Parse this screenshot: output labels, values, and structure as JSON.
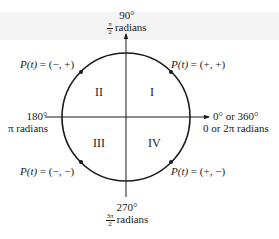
{
  "diagram": {
    "type": "unit-circle-quadrants",
    "center": {
      "x": 126,
      "y": 117
    },
    "radius": 64,
    "colors": {
      "stroke": "#1a1a1a",
      "background": "#ffffff",
      "band": "#f4f4f4"
    }
  },
  "axes": {
    "top": {
      "degrees": "90°",
      "radians_num": "π",
      "radians_den": "2",
      "radians_word": "radians"
    },
    "left": {
      "degrees": "180°",
      "radians": "π radians"
    },
    "right": {
      "degrees": "0° or 360°",
      "radians": "0 or 2π radians"
    },
    "bottom": {
      "degrees": "270°",
      "radians_num": "3π",
      "radians_den": "2",
      "radians_word": "radians"
    }
  },
  "quadrants": [
    {
      "numeral": "I"
    },
    {
      "numeral": "II"
    },
    {
      "numeral": "III"
    },
    {
      "numeral": "IV"
    }
  ],
  "points": [
    {
      "label_fn": "P(t)",
      "label_rest": " = (+, +)",
      "quadrant": "I"
    },
    {
      "label_fn": "P(t)",
      "label_rest": " = (−, +)",
      "quadrant": "II"
    },
    {
      "label_fn": "P(t)",
      "label_rest": " = (−, −)",
      "quadrant": "III"
    },
    {
      "label_fn": "P(t)",
      "label_rest": " = (+, −)",
      "quadrant": "IV"
    }
  ]
}
